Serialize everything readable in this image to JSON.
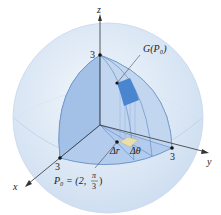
{
  "figure": {
    "axis_labels": {
      "x": "x",
      "y": "y",
      "z": "z"
    },
    "tick_labels": {
      "x": "3",
      "y": "3",
      "z": "3"
    },
    "image_label": "G(P₀)",
    "delta_r": "Δr",
    "delta_theta": "Δθ",
    "point_label_prefix": "P₀ = (2, ",
    "point_label_frac_num": "π",
    "point_label_frac_den": "3",
    "point_label_suffix": ")",
    "colors": {
      "sphere": "#dce8f5",
      "octant": "#a9c6ea",
      "patch": "#4a86cf",
      "base_patch": "#e8dfae"
    }
  }
}
